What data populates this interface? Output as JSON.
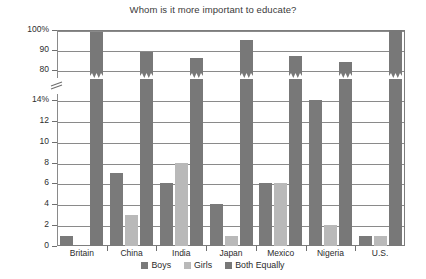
{
  "chart_data": {
    "type": "bar",
    "title": "Whom is it more important to educate?",
    "xlabel": "",
    "ylabel": "",
    "categories": [
      "Britain",
      "China",
      "India",
      "Japan",
      "Mexico",
      "Nigeria",
      "U.S."
    ],
    "series": [
      {
        "name": "Boys",
        "color": "#7a7a7a",
        "values": [
          1,
          7,
          6,
          4,
          6,
          14,
          1
        ]
      },
      {
        "name": "Girls",
        "color": "#b9b9b9",
        "values": [
          0,
          3,
          8,
          1,
          6,
          2,
          1
        ]
      },
      {
        "name": "Both Equally",
        "color": "#787878",
        "values": [
          99,
          89,
          86,
          95,
          87,
          84,
          100
        ]
      }
    ],
    "ylim": [
      0,
      100
    ],
    "axis_break": {
      "lower_max": 14,
      "upper_min": 80
    },
    "ytick_labels": [
      "0",
      "2",
      "4",
      "6",
      "8",
      "10",
      "12",
      "14%",
      "80",
      "90",
      "100%"
    ],
    "ytick_values": [
      0,
      2,
      4,
      6,
      8,
      10,
      12,
      14,
      80,
      90,
      100
    ],
    "grid": true,
    "legend_position": "bottom"
  }
}
